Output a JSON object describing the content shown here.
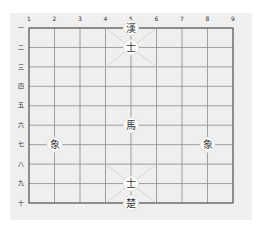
{
  "board": {
    "columns": 9,
    "rows": 10,
    "column_labels": [
      "1",
      "2",
      "3",
      "4",
      "5",
      "6",
      "7",
      "8",
      "9"
    ],
    "row_labels": [
      "一",
      "二",
      "三",
      "四",
      "五",
      "六",
      "七",
      "八",
      "九",
      "十"
    ],
    "palaces": [
      {
        "cols": [
          4,
          6
        ],
        "rows": [
          1,
          3
        ]
      },
      {
        "cols": [
          4,
          6
        ],
        "rows": [
          8,
          10
        ]
      }
    ]
  },
  "pieces": [
    {
      "char": "漢",
      "name": "han-general",
      "col": 5,
      "row": 1
    },
    {
      "char": "士",
      "name": "advisor-top",
      "col": 5,
      "row": 2
    },
    {
      "char": "馬",
      "name": "horse",
      "col": 5,
      "row": 6
    },
    {
      "char": "象",
      "name": "elephant-left",
      "col": 2,
      "row": 7
    },
    {
      "char": "象",
      "name": "elephant-right",
      "col": 8,
      "row": 7
    },
    {
      "char": "士",
      "name": "advisor-bottom",
      "col": 5,
      "row": 9
    },
    {
      "char": "楚",
      "name": "chu-general",
      "col": 5,
      "row": 10
    }
  ]
}
